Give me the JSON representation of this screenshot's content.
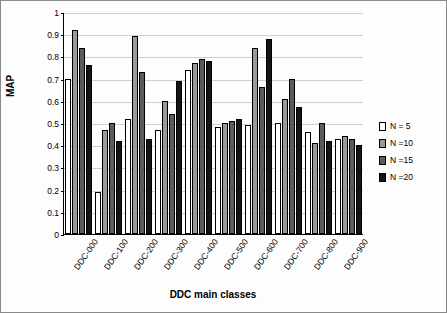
{
  "chart_data": {
    "type": "bar",
    "title": "",
    "xlabel": "DDC main classes",
    "ylabel": "MAP",
    "ylim": [
      0,
      1
    ],
    "yticks": [
      0,
      0.1,
      0.2,
      0.3,
      0.4,
      0.5,
      0.6,
      0.7,
      0.8,
      0.9,
      1
    ],
    "ytick_labels": [
      "0",
      "0.1",
      "0.2",
      "0.3",
      "0.4",
      "0.5",
      "0.6",
      "0.7",
      "0.8",
      "0.9",
      "1"
    ],
    "grid": true,
    "legend_position": "right",
    "categories": [
      "DDC-000",
      "DDC-100",
      "DDC-200",
      "DDC-300",
      "DDC-400",
      "DDC-500",
      "DDC-600",
      "DDC-700",
      "DDC-800",
      "DDC-900"
    ],
    "series": [
      {
        "name": "N = 5",
        "color": "#ffffff",
        "values": [
          0.7,
          0.19,
          0.52,
          0.47,
          0.74,
          0.48,
          0.49,
          0.5,
          0.46,
          0.43
        ]
      },
      {
        "name": "N =10",
        "color": "#9a9a9a",
        "values": [
          0.92,
          0.47,
          0.89,
          0.6,
          0.77,
          0.5,
          0.84,
          0.61,
          0.41,
          0.44
        ]
      },
      {
        "name": "N =15",
        "color": "#5b5b5b",
        "values": [
          0.84,
          0.5,
          0.73,
          0.54,
          0.79,
          0.51,
          0.66,
          0.7,
          0.5,
          0.43
        ]
      },
      {
        "name": "N =20",
        "color": "#141414",
        "values": [
          0.76,
          0.42,
          0.43,
          0.69,
          0.78,
          0.52,
          0.88,
          0.57,
          0.42,
          0.4
        ]
      }
    ]
  }
}
